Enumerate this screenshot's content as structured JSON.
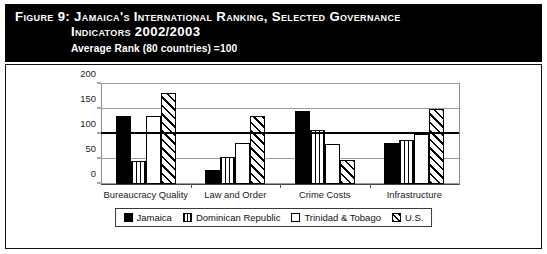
{
  "header": {
    "title_line_1": "Figure 9:  Jamaica's International Ranking, Selected Governance",
    "title_line_2": "Indicators 2002/2003",
    "subtitle": "Average Rank (80 countries) =100",
    "background_color": "#000000",
    "text_color": "#ffffff"
  },
  "chart_data": {
    "type": "bar",
    "title": "Jamaica's International Ranking, Selected Governance Indicators 2002/2003",
    "subtitle": "Average Rank (80 countries) =100",
    "xlabel": "",
    "ylabel": "",
    "ylim": [
      0,
      200
    ],
    "yticks": [
      0,
      50,
      100,
      150,
      200
    ],
    "ytick_labels": [
      "0",
      "50",
      "100",
      "150",
      "200"
    ],
    "grid": true,
    "reference_line": {
      "value": 100,
      "label": "Average Rank = 100",
      "bold": true,
      "color": "#000000"
    },
    "legend_position": "bottom",
    "categories": [
      "Bureaucracy Quality",
      "Law and Order",
      "Crime Costs",
      "Infrastructure"
    ],
    "series": [
      {
        "name": "Jamaica",
        "fill": "solid",
        "color": "#000000",
        "values": [
          136,
          28,
          147,
          82
        ]
      },
      {
        "name": "Dominican Republic",
        "fill": "vertical",
        "color": "#000000",
        "values": [
          47,
          55,
          108,
          88
        ]
      },
      {
        "name": "Trinidad & Tobago",
        "fill": "white",
        "color": "#ffffff",
        "values": [
          136,
          82,
          80,
          100
        ]
      },
      {
        "name": "U.S.",
        "fill": "diagonal",
        "color": "#000000",
        "values": [
          182,
          137,
          48,
          150
        ]
      }
    ]
  },
  "legend": {
    "items": [
      {
        "label": "Jamaica",
        "fill": "solid"
      },
      {
        "label": "Dominican Republic",
        "fill": "vertical"
      },
      {
        "label": "Trinidad & Tobago",
        "fill": "white"
      },
      {
        "label": "U.S.",
        "fill": "diagonal"
      }
    ]
  }
}
